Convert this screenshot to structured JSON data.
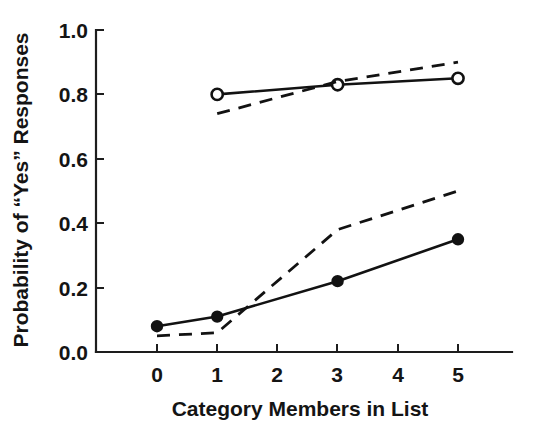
{
  "chart_data": {
    "type": "line",
    "title": "",
    "xlabel": "Category Members in List",
    "ylabel": "Probability of “Yes” Responses",
    "xlim": [
      -0.6,
      5.9
    ],
    "ylim": [
      0.0,
      1.0
    ],
    "grid": false,
    "legend": "none",
    "xticks": [
      0,
      1,
      2,
      3,
      4,
      5
    ],
    "xtick_labels": [
      "0",
      "1",
      "2",
      "3",
      "4",
      "5"
    ],
    "yticks": [
      0.0,
      0.2,
      0.4,
      0.6,
      0.8,
      1.0
    ],
    "ytick_labels": [
      "0.0",
      "0.2",
      "0.4",
      "0.6",
      "0.8",
      "1.0"
    ],
    "series": [
      {
        "name": "observed-high",
        "style": "solid",
        "marker": "open-circle",
        "x": [
          1,
          3,
          5
        ],
        "values": [
          0.8,
          0.83,
          0.85
        ]
      },
      {
        "name": "predicted-high",
        "style": "dashed",
        "marker": "none",
        "x": [
          1,
          3,
          5
        ],
        "values": [
          0.74,
          0.84,
          0.9
        ]
      },
      {
        "name": "observed-low",
        "style": "solid",
        "marker": "filled-circle",
        "x": [
          0,
          1,
          3,
          5
        ],
        "values": [
          0.08,
          0.11,
          0.22,
          0.35
        ]
      },
      {
        "name": "predicted-low",
        "style": "dashed",
        "marker": "none",
        "x": [
          0,
          1,
          3,
          5
        ],
        "values": [
          0.05,
          0.06,
          0.38,
          0.5
        ]
      }
    ]
  },
  "axes": {
    "x_title": "Category Members in List",
    "y_title": "Probability of “Yes” Responses"
  },
  "y_labels": {
    "t0": "0.0",
    "t1": "0.2",
    "t2": "0.4",
    "t3": "0.6",
    "t4": "0.8",
    "t5": "1.0"
  },
  "x_labels": {
    "t0": "0",
    "t1": "1",
    "t2": "2",
    "t3": "3",
    "t4": "4",
    "t5": "5"
  },
  "colors": {
    "ink": "#121212",
    "background": "#ffffff"
  }
}
